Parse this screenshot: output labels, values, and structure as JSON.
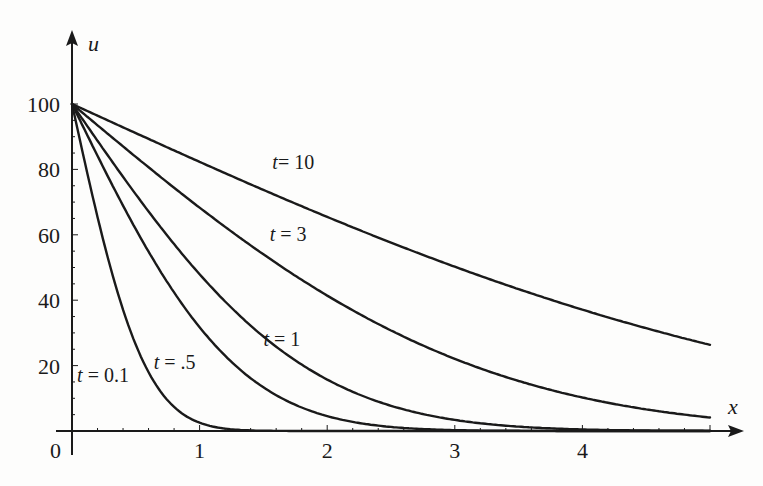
{
  "chart_data": {
    "type": "line",
    "title": "",
    "xlabel": "x",
    "ylabel": "u",
    "xlim": [
      0,
      5.2
    ],
    "ylim": [
      0,
      115
    ],
    "grid": false,
    "legend": "none (inline curve labels)",
    "x_ticks": [
      "1",
      "2",
      "3",
      "4"
    ],
    "y_ticks": [
      "20",
      "40",
      "60",
      "80",
      "100"
    ],
    "origin_label": "0",
    "model": "u = 100 * erfc(x / (2*sqrt(t)))",
    "x": [
      0,
      0.25,
      0.5,
      0.75,
      1,
      1.25,
      1.5,
      2,
      2.5,
      3,
      3.5,
      4,
      4.5,
      5
    ],
    "series": [
      {
        "name": "t = 0.1",
        "label": "t = 0.1",
        "t": 0.1,
        "values": [
          100,
          57.7,
          25.7,
          8.9,
          2.3,
          0.5,
          0.1,
          0,
          0,
          0,
          0,
          0,
          0,
          0
        ]
      },
      {
        "name": "t = .5",
        "label": "t = .5",
        "t": 0.5,
        "values": [
          100,
          80.3,
          61.7,
          45.2,
          31.7,
          21.1,
          13.3,
          4.6,
          1.2,
          0.3,
          0.1,
          0,
          0,
          0
        ]
      },
      {
        "name": "t = 1",
        "label": "t = 1",
        "t": 1,
        "values": [
          100,
          85.9,
          72.4,
          59.7,
          48.0,
          37.7,
          28.9,
          15.7,
          7.7,
          3.4,
          1.3,
          0.5,
          0.1,
          0
        ]
      },
      {
        "name": "t = 3",
        "label": "t = 3",
        "t": 3,
        "values": [
          100,
          91.9,
          83.9,
          76.1,
          68.5,
          61.3,
          54.4,
          41.6,
          30.8,
          22.2,
          15.5,
          10.4,
          6.9,
          4.4
        ]
      },
      {
        "name": "t = 10",
        "label": "t= 10",
        "t": 10,
        "values": [
          100,
          95.5,
          91.1,
          86.6,
          82.3,
          77.9,
          73.6,
          65.5,
          57.7,
          50.4,
          43.7,
          37.1,
          31.1,
          26.4
        ]
      }
    ],
    "label_positions": [
      {
        "series": "t = 0.1",
        "x": 0.04,
        "y": 15
      },
      {
        "series": "t = .5",
        "x": 0.64,
        "y": 19
      },
      {
        "series": "t = 1",
        "x": 1.5,
        "y": 26
      },
      {
        "series": "t = 3",
        "x": 1.55,
        "y": 58
      },
      {
        "series": "t = 10",
        "x": 1.57,
        "y": 80
      }
    ]
  },
  "colors": {
    "line": "#1a1a1a",
    "background": "#fdfdfc"
  }
}
